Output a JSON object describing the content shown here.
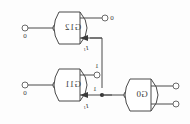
{
  "diagram": {
    "orientation": "mirrored-horizontal",
    "gates": [
      {
        "id": "g12",
        "label": "G12",
        "type": "nor",
        "inverting_input_bubble": true
      },
      {
        "id": "g11",
        "label": "G11",
        "type": "nor",
        "inverting_input_bubble": true
      },
      {
        "id": "g0",
        "label": "G0",
        "type": "nor",
        "inverting_input_bubble": true
      }
    ],
    "ports": [
      {
        "id": "in-top",
        "value": "0"
      },
      {
        "id": "in-bottom",
        "value": "0"
      },
      {
        "id": "out-top",
        "value": "0"
      },
      {
        "id": "g11-upper-stub",
        "value": "1"
      },
      {
        "id": "out-g0-a",
        "value": ""
      },
      {
        "id": "out-g0-b",
        "value": ""
      }
    ],
    "signal_values": {
      "input_top": "0",
      "input_bottom": "0",
      "output_top": "0",
      "g11_stub": "1",
      "junction": "1"
    },
    "annotations": [
      {
        "id": "arrow-top",
        "label": "I",
        "subscript": "1"
      },
      {
        "id": "arrow-bottom",
        "label": "I",
        "subscript": "1"
      }
    ],
    "colors": {
      "wire": "#4a4a4a",
      "gate_stroke": "#4a4a4a",
      "gate_fill": "#ffffff",
      "text": "#3a3a3a",
      "background": "#fdfdfd",
      "junction_dot": "#333333"
    }
  }
}
